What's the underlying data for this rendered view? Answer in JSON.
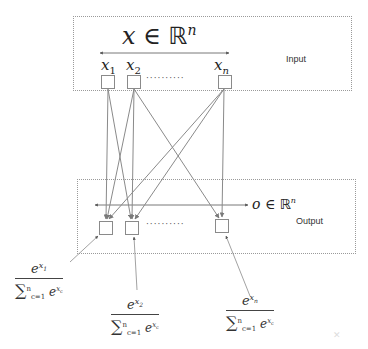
{
  "input_layer": {
    "label": "Input",
    "set_notation": {
      "var": "x",
      "op": "∈",
      "space": "ℝ",
      "exp": "n"
    },
    "nodes": [
      {
        "label_base": "x",
        "label_sub": "1"
      },
      {
        "label_base": "x",
        "label_sub": "2"
      },
      {
        "label_base": "x",
        "label_sub": "n"
      }
    ],
    "ellipsis": "··········"
  },
  "output_layer": {
    "label": "Output",
    "set_notation": {
      "var": "o",
      "op": "∈",
      "space": "ℝ",
      "exp": "n"
    },
    "ellipsis": "··········"
  },
  "softmax_formulas": [
    {
      "num_base": "e",
      "num_exp_var": "x",
      "num_exp_sub": "1",
      "sigma": "∑",
      "sum_upper": "n",
      "sum_lower": "c=1",
      "den_base": "e",
      "den_exp_var": "x",
      "den_exp_sub": "c"
    },
    {
      "num_base": "e",
      "num_exp_var": "x",
      "num_exp_sub": "2",
      "sigma": "∑",
      "sum_upper": "n",
      "sum_lower": "c=1",
      "den_base": "e",
      "den_exp_var": "x",
      "den_exp_sub": "c"
    },
    {
      "num_base": "e",
      "num_exp_var": "x",
      "num_exp_sub": "n",
      "sigma": "∑",
      "sum_upper": "n",
      "sum_lower": "c=1",
      "den_base": "e",
      "den_exp_var": "x",
      "den_exp_sub": "c"
    }
  ],
  "colors": {
    "arrow": "#8a8a8a",
    "frame": "#9a9a9a",
    "text": "#222222"
  }
}
